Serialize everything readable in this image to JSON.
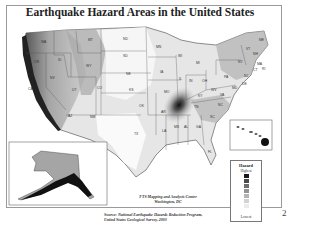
{
  "title": "Earthquake Hazard Areas in the United States",
  "states": [
    "WA",
    "OR",
    "CA",
    "NV",
    "ID",
    "MT",
    "WY",
    "UT",
    "CO",
    "AZ",
    "NM",
    "ND",
    "SD",
    "NE",
    "KS",
    "OK",
    "TX",
    "MN",
    "IA",
    "MO",
    "AR",
    "LA",
    "WI",
    "IL",
    "MI",
    "IN",
    "OH",
    "KY",
    "TN",
    "MS",
    "AL",
    "GA",
    "FL",
    "SC",
    "NC",
    "VA",
    "WV",
    "PA",
    "NY",
    "VT",
    "NH",
    "ME",
    "MA",
    "CT",
    "RI",
    "NJ",
    "DE",
    "MD"
  ],
  "legend": {
    "title": "Hazard",
    "high_label": "Highest",
    "low_label": "Lowest",
    "levels": [
      "#1a1a1a",
      "#4a4a4a",
      "#6e6e6e",
      "#939393",
      "#b4b4b4",
      "#d2d2d2",
      "#ebebeb"
    ]
  },
  "credit": {
    "line1": "FTS Mapping and Analysis Center",
    "line2": "Washington, DC"
  },
  "source": {
    "line1": "Source: National Earthquake Hazards Reduction Program,",
    "line2": "United States Geological Survey, 2003"
  },
  "insets": [
    "Alaska",
    "Hawaii"
  ],
  "page_number": "2"
}
